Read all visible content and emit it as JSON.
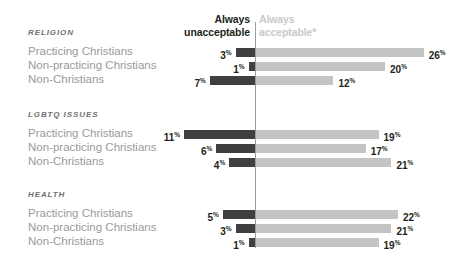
{
  "headers": {
    "left": "Always\nunacceptable",
    "left_line1": "Always",
    "left_line2": "unacceptable",
    "right_line1": "Always",
    "right_line2": "acceptable*"
  },
  "colors": {
    "unacceptable_bar": "#3f3f3f",
    "acceptable_bar": "#c4c4c4",
    "axis": "#9b9b9b",
    "value_text": "#231f20",
    "row_label": "#9a9a9a",
    "section_title": "#6f6f6f",
    "header_right_text": "#c9c9c9",
    "background": "#ffffff"
  },
  "chart_data": {
    "type": "bar",
    "title": "",
    "subtitle": "",
    "xlabel": "",
    "ylabel": "",
    "grid": false,
    "legend_position": "top",
    "orientation": "horizontal",
    "style": "diverging-bidirectional",
    "unit": "%",
    "axis_origin_value": 0,
    "xlim": [
      -12,
      28
    ],
    "series": [
      {
        "name": "Always unacceptable",
        "color": "#3f3f3f",
        "direction": "left"
      },
      {
        "name": "Always acceptable*",
        "color": "#c4c4c4",
        "direction": "right"
      }
    ],
    "groups": [
      {
        "label": "RELIGION",
        "rows": [
          {
            "category": "Practicing Christians",
            "unacceptable": 3,
            "acceptable": 26
          },
          {
            "category": "Non-practicing Christians",
            "unacceptable": 1,
            "acceptable": 20
          },
          {
            "category": "Non-Christians",
            "unacceptable": 7,
            "acceptable": 12
          }
        ]
      },
      {
        "label": "LGBTQ ISSUES",
        "rows": [
          {
            "category": "Practicing Christians",
            "unacceptable": 11,
            "acceptable": 19
          },
          {
            "category": "Non-practicing Christians",
            "unacceptable": 6,
            "acceptable": 17
          },
          {
            "category": "Non-Christians",
            "unacceptable": 4,
            "acceptable": 21
          }
        ]
      },
      {
        "label": "HEALTH",
        "rows": [
          {
            "category": "Practicing Christians",
            "unacceptable": 5,
            "acceptable": 22
          },
          {
            "category": "Non-practicing Christians",
            "unacceptable": 3,
            "acceptable": 21
          },
          {
            "category": "Non-Christians",
            "unacceptable": 1,
            "acceptable": 19
          }
        ]
      }
    ]
  }
}
